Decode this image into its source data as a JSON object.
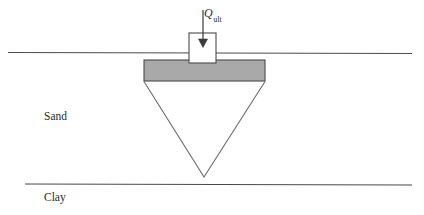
{
  "figure": {
    "width": 424,
    "height": 215,
    "background_color": "#ffffff"
  },
  "labels": {
    "sand": "Sand",
    "clay": "Clay",
    "load_symbol": "Q",
    "load_subscript": "ult"
  },
  "strata": [
    {
      "name": "Sand",
      "label": "Sand",
      "boundary": "ground-surface-line",
      "label_x": 44,
      "label_y": 111
    },
    {
      "name": "Clay",
      "label": "Clay",
      "boundary": "sand-clay-interface-line",
      "label_x": 44,
      "label_y": 192
    }
  ],
  "geometry": {
    "ground_line": {
      "x1": 8,
      "y1": 52,
      "x2": 412,
      "y2": 53
    },
    "clay_line": {
      "x1": 25,
      "y1": 184,
      "x2": 412,
      "y2": 185
    },
    "footing_slab": {
      "x": 144,
      "y": 60,
      "width": 121,
      "height": 21
    },
    "column": {
      "x": 189,
      "y": 33,
      "width": 27,
      "height": 30
    },
    "load_arrow": {
      "x": 203,
      "y_start": 10,
      "y_end": 47
    },
    "failure_wedge": {
      "left_x": 144,
      "right_x": 265,
      "top_y": 81,
      "apex_x": 204,
      "apex_y": 177
    }
  },
  "colors": {
    "line": "#4a4a4a",
    "slab_fill": "#a9a9a9",
    "slab_stroke": "#4a4a4a",
    "column_fill": "#ffffff",
    "column_stroke": "#4a4a4a",
    "wedge_stroke": "#6b6b6b",
    "text": "#2b2b2b"
  }
}
